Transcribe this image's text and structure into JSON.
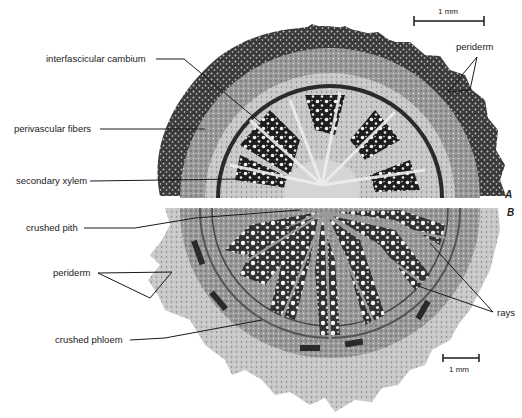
{
  "figure": {
    "halves": {
      "top": "A",
      "bottom": "B"
    },
    "scale_bars": {
      "top": "1 mm",
      "bottom": "1 mm"
    },
    "labels": {
      "interfascicular_cambium": "interfascicular cambium",
      "perivascular_fibers": "perivascular fibers",
      "secondary_xylem": "secondary xylem",
      "crushed_pith": "crushed pith",
      "periderm_left": "periderm",
      "crushed_phloem": "crushed phloem",
      "periderm_right": "periderm",
      "rays": "rays"
    },
    "colors": {
      "background": "#ffffff",
      "ink": "#1a1a1a",
      "tissue_dark": "#2a2a2a",
      "tissue_mid": "#8a8a8a",
      "tissue_light": "#d8d8d8"
    }
  }
}
